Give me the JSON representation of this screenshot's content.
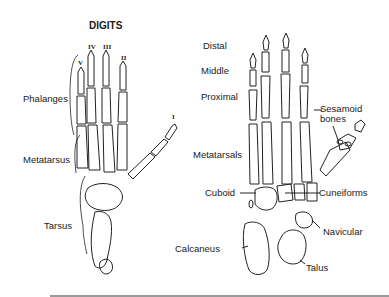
{
  "left_diagram": {
    "title": "DIGITS",
    "digit_numerals": [
      "V",
      "IV",
      "III",
      "II",
      "I"
    ],
    "labels": {
      "phalanges": "Phalanges",
      "metatarsus": "Metatarsus",
      "tarsus": "Tarsus"
    }
  },
  "right_diagram": {
    "labels": {
      "distal": "Distal",
      "middle": "Middle",
      "proximal": "Proximal",
      "sesamoid_line1": "Sesamoid",
      "sesamoid_line2": "bones",
      "metatarsals": "Metatarsals",
      "cuboid": "Cuboid",
      "cuneiforms": "Cuneiforms",
      "navicular": "Navicular",
      "calcaneus": "Calcaneus",
      "talus": "Talus"
    }
  },
  "colors": {
    "ink": "#1a1a1a",
    "background": "#ffffff",
    "rule": "#9a9a9a"
  }
}
